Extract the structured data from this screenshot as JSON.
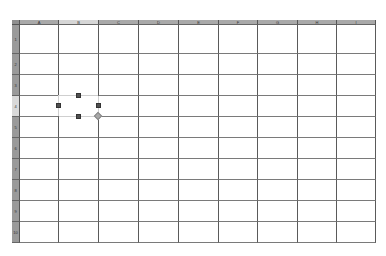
{
  "spreadsheet": {
    "columns": [
      "A",
      "B",
      "C",
      "D",
      "E",
      "F",
      "G",
      "H",
      "I"
    ],
    "rows": [
      "1",
      "2",
      "3",
      "4",
      "5",
      "6",
      "7",
      "8",
      "9",
      "10"
    ],
    "selected_cell": "B4",
    "selected_column": "B",
    "selected_row": "4",
    "cells": []
  },
  "colors": {
    "header_bg": "#a9a9a9",
    "header_selected_bg": "#d6d6d6",
    "grid_line": "#5a5a5a",
    "handle": "#505050",
    "fill_handle": "#a8a8a8"
  },
  "selection_handles": [
    "top-middle",
    "left-middle",
    "right-middle",
    "bottom-middle",
    "bottom-right-fill"
  ]
}
